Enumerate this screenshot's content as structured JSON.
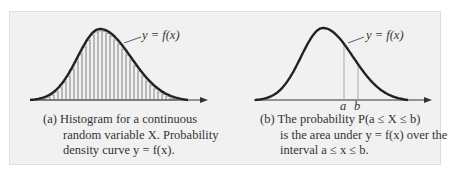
{
  "figure": {
    "panel_a": {
      "curve_label": "y = f(x)",
      "caption_lines": [
        "(a) Histogram for a continuous",
        "random variable X. Probability",
        "density curve y = f(x)."
      ]
    },
    "panel_b": {
      "curve_label": "y = f(x)",
      "a_label": "a",
      "b_label": "b",
      "caption_lines": [
        "(b) The probability P(a ≤ X ≤ b)",
        "is the area under y = f(x) over the",
        "interval a ≤ x ≤ b."
      ]
    },
    "colors": {
      "background": "#f1f1f1",
      "curve": "#222222",
      "bars": "#9a9a9a",
      "text": "#333333"
    }
  }
}
